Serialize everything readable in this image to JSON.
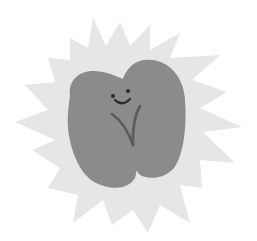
{
  "illustration": {
    "subject": "Smiling seed/bean character on starburst",
    "alt": "A grey two-lobed seed with a smiling face and a V-shaped sprout line, set on a light grey starburst",
    "colors": {
      "background": "#ffffff",
      "starburst": "#e6e6e6",
      "bean": "#8b8b8b",
      "face": "#2b2b2b",
      "sprout": "#5a5a5a"
    }
  }
}
